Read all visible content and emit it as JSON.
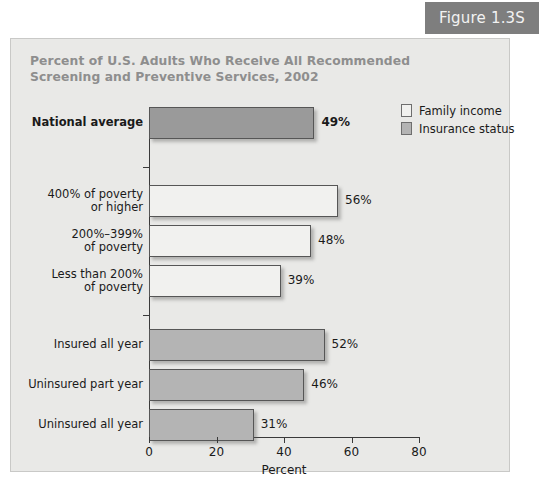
{
  "figure": {
    "badge_label": "Figure 1.3S"
  },
  "chart_data": {
    "type": "bar",
    "orientation": "horizontal",
    "title": "Percent of U.S. Adults Who Receive All Recommended Screening and Preventive Services, 2002",
    "title_lines": [
      "Percent of U.S. Adults Who Receive All Recommended",
      "Screening and Preventive Services, 2002"
    ],
    "xlabel": "Percent",
    "ylabel": "",
    "xlim": [
      0,
      80
    ],
    "xticks": [
      0,
      20,
      40,
      60,
      80
    ],
    "xtick_labels": [
      "0",
      "20",
      "40",
      "60",
      "80"
    ],
    "grid": false,
    "legend_position": "top-right",
    "legend": [
      {
        "name": "Family income",
        "color": "#f1f1ef"
      },
      {
        "name": "Insurance status",
        "color": "#b4b4b4"
      }
    ],
    "categories": [
      "National average",
      "400% of poverty or higher",
      "200%–399% of poverty",
      "Less than 200% of poverty",
      "Insured all year",
      "Uninsured part year",
      "Uninsured all year"
    ],
    "values": [
      49,
      56,
      48,
      39,
      52,
      46,
      31
    ],
    "value_labels": [
      "49%",
      "48%",
      "56%",
      "39%",
      "52%",
      "46%",
      "31%"
    ],
    "groups": [
      {
        "name": "National average",
        "series": "national",
        "bars": [
          {
            "label_lines": [
              "National average"
            ],
            "value": 49,
            "value_label": "49%",
            "series": "national",
            "emphasis": true
          }
        ]
      },
      {
        "name": "Family income",
        "series": "income",
        "bars": [
          {
            "label_lines": [
              "400% of poverty",
              "or higher"
            ],
            "value": 56,
            "value_label": "56%",
            "series": "income",
            "emphasis": false
          },
          {
            "label_lines": [
              "200%–399%",
              "of poverty"
            ],
            "value": 48,
            "value_label": "48%",
            "series": "income",
            "emphasis": false
          },
          {
            "label_lines": [
              "Less than 200%",
              "of poverty"
            ],
            "value": 39,
            "value_label": "39%",
            "series": "income",
            "emphasis": false
          }
        ]
      },
      {
        "name": "Insurance status",
        "series": "insurance",
        "bars": [
          {
            "label_lines": [
              "Insured all year"
            ],
            "value": 52,
            "value_label": "52%",
            "series": "insurance",
            "emphasis": false
          },
          {
            "label_lines": [
              "Uninsured part year"
            ],
            "value": 46,
            "value_label": "46%",
            "series": "insurance",
            "emphasis": false
          },
          {
            "label_lines": [
              "Uninsured all year"
            ],
            "value": 31,
            "value_label": "31%",
            "series": "insurance",
            "emphasis": false
          }
        ]
      }
    ]
  },
  "colors": {
    "badge_background": "#7e7e7e",
    "badge_text": "#f2f2f2",
    "panel_background": "#e9e9e7",
    "title_text": "#8e8e8e",
    "bar_national": "#9a9a9a",
    "bar_income": "#f1f1ef",
    "bar_insurance": "#b4b4b4",
    "axis": "#3a3a3a",
    "text": "#1a1a1a"
  }
}
